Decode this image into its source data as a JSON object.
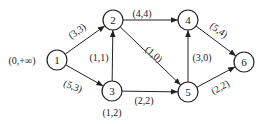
{
  "diagram": {
    "type": "network-flow-graph",
    "nodes": [
      {
        "id": "1",
        "label": "1",
        "x": 57,
        "y": 60,
        "annotation": "(0,+∞)",
        "ax": 22,
        "ay": 60
      },
      {
        "id": "2",
        "label": "2",
        "x": 113,
        "y": 20
      },
      {
        "id": "3",
        "label": "3",
        "x": 112,
        "y": 91,
        "annotation": "(1,2)",
        "ax": 112,
        "ay": 112
      },
      {
        "id": "4",
        "label": "4",
        "x": 188,
        "y": 20
      },
      {
        "id": "5",
        "label": "5",
        "x": 188,
        "y": 92
      },
      {
        "id": "6",
        "label": "6",
        "x": 244,
        "y": 62
      }
    ],
    "edges": [
      {
        "from": "1",
        "to": "2",
        "label": "(3,3)",
        "lx": 77,
        "ly": 31,
        "rot": -35
      },
      {
        "from": "1",
        "to": "3",
        "label": "(5,3)",
        "lx": 73,
        "ly": 86,
        "rot": 22
      },
      {
        "from": "3",
        "to": "2",
        "label": "(1,1)",
        "lx": 99,
        "ly": 57,
        "rot": 0
      },
      {
        "from": "2",
        "to": "4",
        "label": "(4,4)",
        "lx": 142,
        "ly": 13,
        "rot": 0
      },
      {
        "from": "2",
        "to": "5",
        "label": "(1,0)",
        "lx": 154,
        "ly": 54,
        "rot": 40
      },
      {
        "from": "3",
        "to": "5",
        "label": "(2,2)",
        "lx": 144,
        "ly": 100,
        "rot": 0
      },
      {
        "from": "5",
        "to": "4",
        "label": "(3,0)",
        "lx": 202,
        "ly": 57,
        "rot": 0
      },
      {
        "from": "4",
        "to": "6",
        "label": "(5,4)",
        "lx": 219,
        "ly": 30,
        "rot": 35
      },
      {
        "from": "5",
        "to": "6",
        "label": "(2,2)",
        "lx": 220,
        "ly": 87,
        "rot": -30
      }
    ]
  }
}
